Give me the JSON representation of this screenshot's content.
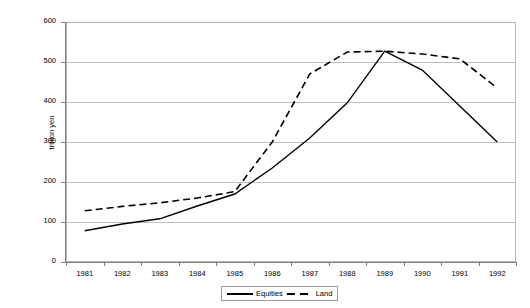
{
  "chart_data": {
    "type": "line",
    "title": "",
    "xlabel": "",
    "ylabel": "trillion yen",
    "categories": [
      "1981",
      "1982",
      "1983",
      "1984",
      "1985",
      "1986",
      "1987",
      "1988",
      "1989",
      "1990",
      "1991",
      "1992"
    ],
    "ylim": [
      0,
      600
    ],
    "yticks": [
      0,
      100,
      200,
      300,
      400,
      500,
      600
    ],
    "ytick_labels": [
      "0",
      "100",
      "200",
      "300",
      "400",
      "500",
      "600"
    ],
    "grid": "horizontal",
    "legend_position": "bottom-center",
    "series": [
      {
        "name": "Equities",
        "style": "solid",
        "color": "#000000",
        "values": [
          78,
          95,
          108,
          140,
          170,
          235,
          310,
          398,
          527,
          480,
          390,
          300
        ]
      },
      {
        "name": "Land",
        "style": "dashed",
        "color": "#000000",
        "values": [
          128,
          139,
          148,
          160,
          176,
          300,
          470,
          525,
          527,
          520,
          508,
          435
        ]
      }
    ]
  },
  "legend": {
    "items": [
      {
        "label": "Equities",
        "swatch": "solid-line-swatch"
      },
      {
        "label": "Land",
        "swatch": "dashed-line-swatch"
      }
    ]
  }
}
